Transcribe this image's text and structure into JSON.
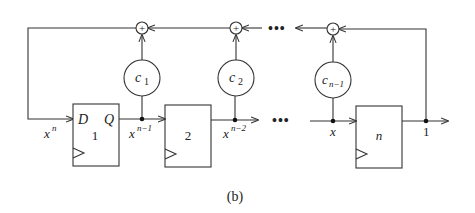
{
  "figure": {
    "caption": "(b)"
  },
  "flipflops": [
    {
      "id": "1",
      "label": "1",
      "d_label": "D",
      "q_label": "Q",
      "input_label": "x^n",
      "output_label": "x^(n-1)"
    },
    {
      "id": "2",
      "label": "2",
      "output_label": "x^(n-2)"
    },
    {
      "id": "n",
      "label": "n",
      "input_label": "x",
      "output_label": "1"
    }
  ],
  "coefficients": [
    {
      "base": "c",
      "sub": "1"
    },
    {
      "base": "c",
      "sub": "2"
    },
    {
      "base": "c",
      "sub": "n−1"
    }
  ],
  "adders": [
    {
      "symbol": "+"
    },
    {
      "symbol": "+"
    },
    {
      "symbol": "+"
    }
  ],
  "labels": {
    "d": "D",
    "q": "Q",
    "xn_base": "x",
    "xn_sup": "n",
    "xn1_base": "x",
    "xn1_sup": "n−1",
    "xn2_base": "x",
    "xn2_sup": "n−2",
    "x": "x",
    "one": "1",
    "ellipsis_top": "•••",
    "ellipsis_mid": "•••"
  },
  "colors": {
    "line": "#333333",
    "background": "#ffffff"
  }
}
